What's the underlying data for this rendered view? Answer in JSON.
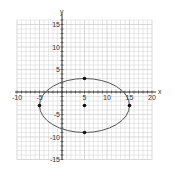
{
  "chart_data": {
    "type": "scatter",
    "title": "",
    "xlabel": "x",
    "ylabel": "y",
    "xlim": [
      -11,
      21
    ],
    "ylim": [
      -16,
      16
    ],
    "grid": true,
    "x_ticks": [
      -10,
      -5,
      5,
      10,
      15,
      20
    ],
    "y_ticks": [
      15,
      10,
      5,
      -5,
      -10,
      -15
    ],
    "x_tick_labels": [
      "-10",
      "-5",
      "5",
      "10",
      "15",
      "20"
    ],
    "y_tick_labels": [
      "15",
      "10",
      "5",
      "-5",
      "-10",
      "-15"
    ],
    "ellipse": {
      "center": [
        5,
        -3
      ],
      "semi_axis_x": 10,
      "semi_axis_y": 6
    },
    "points": [
      {
        "x": 5,
        "y": 3,
        "label": "top vertex"
      },
      {
        "x": 5,
        "y": -3,
        "label": "center"
      },
      {
        "x": 5,
        "y": -9,
        "label": "bottom vertex"
      },
      {
        "x": -5,
        "y": -3,
        "label": "left vertex"
      },
      {
        "x": 15,
        "y": -3,
        "label": "right vertex"
      }
    ],
    "colors": {
      "grid": "#c8c8c8",
      "axes": "#333333",
      "curve": "#555555",
      "points": "#111111"
    }
  }
}
